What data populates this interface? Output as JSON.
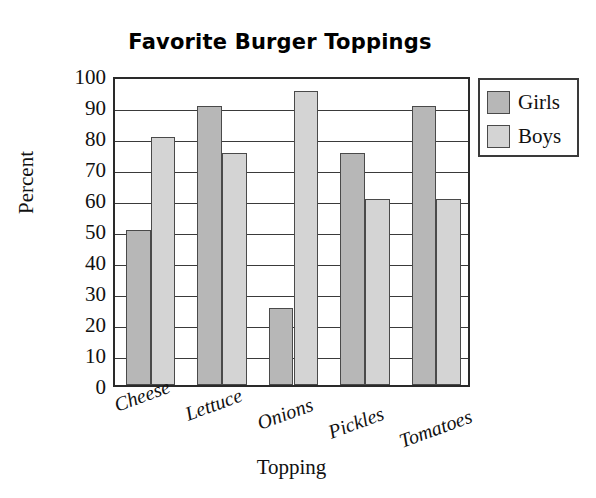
{
  "chart_data": {
    "type": "bar",
    "title": "Favorite Burger Toppings",
    "xlabel": "Topping",
    "ylabel": "Percent",
    "categories": [
      "Cheese",
      "Lettuce",
      "Onions",
      "Pickles",
      "Tomatoes"
    ],
    "series": [
      {
        "name": "Girls",
        "color": "#b7b7b7",
        "values": [
          50,
          90,
          25,
          75,
          90
        ]
      },
      {
        "name": "Boys",
        "color": "#d4d4d4",
        "values": [
          80,
          75,
          95,
          60,
          60
        ]
      }
    ],
    "ylim": [
      0,
      100
    ],
    "yticks": [
      0,
      10,
      20,
      30,
      40,
      50,
      60,
      70,
      80,
      90,
      100
    ],
    "ytick_labels": [
      "0",
      "10",
      "20",
      "30",
      "40",
      "50",
      "60",
      "70",
      "80",
      "90",
      "100"
    ],
    "grid": "horizontal",
    "legend_position": "right-top",
    "legend_entries": [
      "Girls",
      "Boys"
    ]
  }
}
